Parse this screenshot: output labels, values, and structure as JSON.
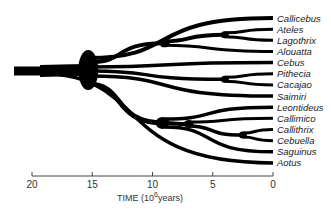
{
  "diagram": {
    "type": "phylogenetic-tree",
    "ink_color": "#000000",
    "taxa": [
      "Callicebus",
      "Ateles",
      "Lagothrix",
      "Alouatta",
      "Cebus",
      "Pithecia",
      "Cacajao",
      "Saimiri",
      "Leontideus",
      "Callimico",
      "Callithrix",
      "Cebuella",
      "Saguinus",
      "Aotus"
    ],
    "divergences_myr": [
      {
        "clade": [
          "Ateles",
          "Lagothrix"
        ],
        "time": 4
      },
      {
        "clade": [
          "Ateles",
          "Lagothrix",
          "Alouatta"
        ],
        "time": 9
      },
      {
        "clade": [
          "Pithecia",
          "Cacajao"
        ],
        "time": 4
      },
      {
        "clade": [
          "Callithrix",
          "Cebuella"
        ],
        "time": 2.5
      },
      {
        "clade": [
          "Callimico",
          "Callithrix",
          "Cebuella"
        ],
        "time": 7
      },
      {
        "clade": [
          "Leontideus",
          "Callimico",
          "Callithrix",
          "Cebuella",
          "Saguinus"
        ],
        "time": 9
      },
      {
        "clade": [
          "Callicebus",
          "Ateles",
          "Lagothrix",
          "Alouatta",
          "Cebus",
          "Pithecia",
          "Cacajao",
          "Saimiri",
          "Leontideus",
          "Callimico",
          "Callithrix",
          "Cebuella",
          "Saguinus"
        ],
        "time": 15
      },
      {
        "clade": [
          "all"
        ],
        "time": 18
      }
    ]
  },
  "axis": {
    "title_prefix": "TIME  (10",
    "title_exp": "6",
    "title_suffix": "years)",
    "ticks": [
      "20",
      "15",
      "10",
      "5",
      "0"
    ],
    "range_myr": [
      20,
      0
    ]
  }
}
